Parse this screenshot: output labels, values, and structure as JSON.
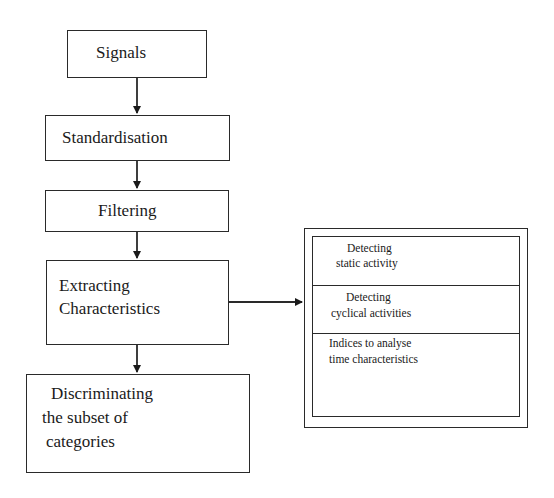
{
  "diagram": {
    "type": "flowchart",
    "nodes": {
      "signals": {
        "label": "Signals"
      },
      "standardisation": {
        "label": "Standardisation"
      },
      "filtering": {
        "label": "Filtering"
      },
      "extracting": {
        "line1": "Extracting",
        "line2": "Characteristics"
      },
      "discriminating": {
        "line1": "Discriminating",
        "line2": "the subset of",
        "line3": "categories"
      }
    },
    "characteristics_panel": {
      "sections": [
        {
          "line1": "Detecting",
          "line2": "static activity"
        },
        {
          "line1": "Detecting",
          "line2": "cyclical  activities"
        },
        {
          "line1": "Indices to analyse",
          "line2": "time characteristics"
        }
      ]
    },
    "edges": [
      {
        "from": "signals",
        "to": "standardisation"
      },
      {
        "from": "standardisation",
        "to": "filtering"
      },
      {
        "from": "filtering",
        "to": "extracting"
      },
      {
        "from": "extracting",
        "to": "discriminating"
      },
      {
        "from": "extracting",
        "to": "characteristics_panel"
      }
    ],
    "colors": {
      "stroke": "#2a2a2a",
      "background": "#ffffff",
      "text": "#1a1a1a"
    }
  }
}
